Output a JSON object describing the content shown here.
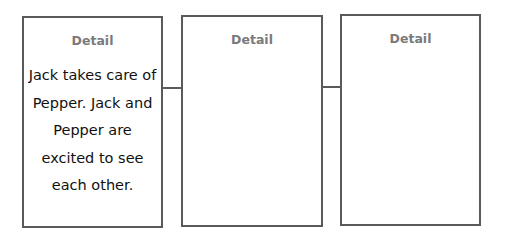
{
  "boxes": [
    {
      "title": "Detail",
      "text": "Jack takes care of Pepper. Jack and Pepper are excited to see each other."
    },
    {
      "title": "Detail",
      "text": ""
    },
    {
      "title": "Detail",
      "text": ""
    }
  ],
  "colors": {
    "border": "#5a5a5a",
    "title": "#7a7a7a",
    "text": "#111111"
  }
}
